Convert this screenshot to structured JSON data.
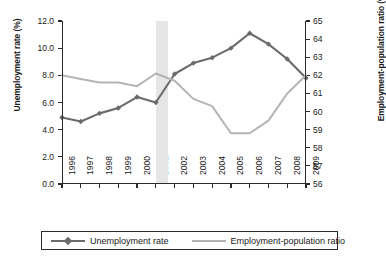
{
  "chart_data": {
    "type": "line",
    "title": "",
    "xlabel": "",
    "x": [
      1996,
      1997,
      1998,
      1999,
      2000,
      2001,
      2002,
      2003,
      2004,
      2005,
      2006,
      2007,
      2008,
      2009
    ],
    "categories": [
      "1996",
      "1997",
      "1998",
      "1999",
      "2000",
      "2001",
      "2002",
      "2003",
      "2004",
      "2005",
      "2006",
      "2007",
      "2008",
      "2009"
    ],
    "grid": false,
    "legend_position": "bottom",
    "axes": {
      "left": {
        "label": "Unemployment rate (%)",
        "ticks": [
          "0.0",
          "2.0",
          "4.0",
          "6.0",
          "8.0",
          "10.0",
          "12.0"
        ],
        "tick_values": [
          0,
          2,
          4,
          6,
          8,
          10,
          12
        ],
        "lim": [
          0,
          12
        ]
      },
      "right": {
        "label": "Employment-population ratio (%)",
        "ticks": [
          "56",
          "57",
          "58",
          "59",
          "60",
          "61",
          "62",
          "63",
          "64",
          "65"
        ],
        "tick_values": [
          56,
          57,
          58,
          59,
          60,
          61,
          62,
          63,
          64,
          65
        ],
        "lim": [
          56,
          65
        ]
      }
    },
    "series": [
      {
        "name": "Unemployment rate",
        "axis": "left",
        "color": "#6b6b6b",
        "marker": "diamond",
        "values": [
          4.9,
          4.6,
          5.2,
          5.6,
          6.4,
          6.0,
          8.1,
          8.9,
          9.3,
          10.0,
          11.1,
          10.3,
          9.2,
          7.8
        ]
      },
      {
        "name": "Employment-population ratio",
        "axis": "right",
        "color": "#b4b4b4",
        "marker": "none",
        "values": [
          62.0,
          61.8,
          61.6,
          61.6,
          61.4,
          62.1,
          61.7,
          60.7,
          60.3,
          58.8,
          58.8,
          59.5,
          61.0,
          62.0
        ]
      }
    ],
    "annotations": [
      {
        "type": "shaded-band",
        "name": "recession-band",
        "from": 2001.0,
        "to": 2001.65,
        "color": "#e6e6e6"
      }
    ]
  },
  "legend": {
    "items": [
      {
        "label": "Unemployment rate"
      },
      {
        "label": "Employment-population ratio"
      }
    ]
  }
}
